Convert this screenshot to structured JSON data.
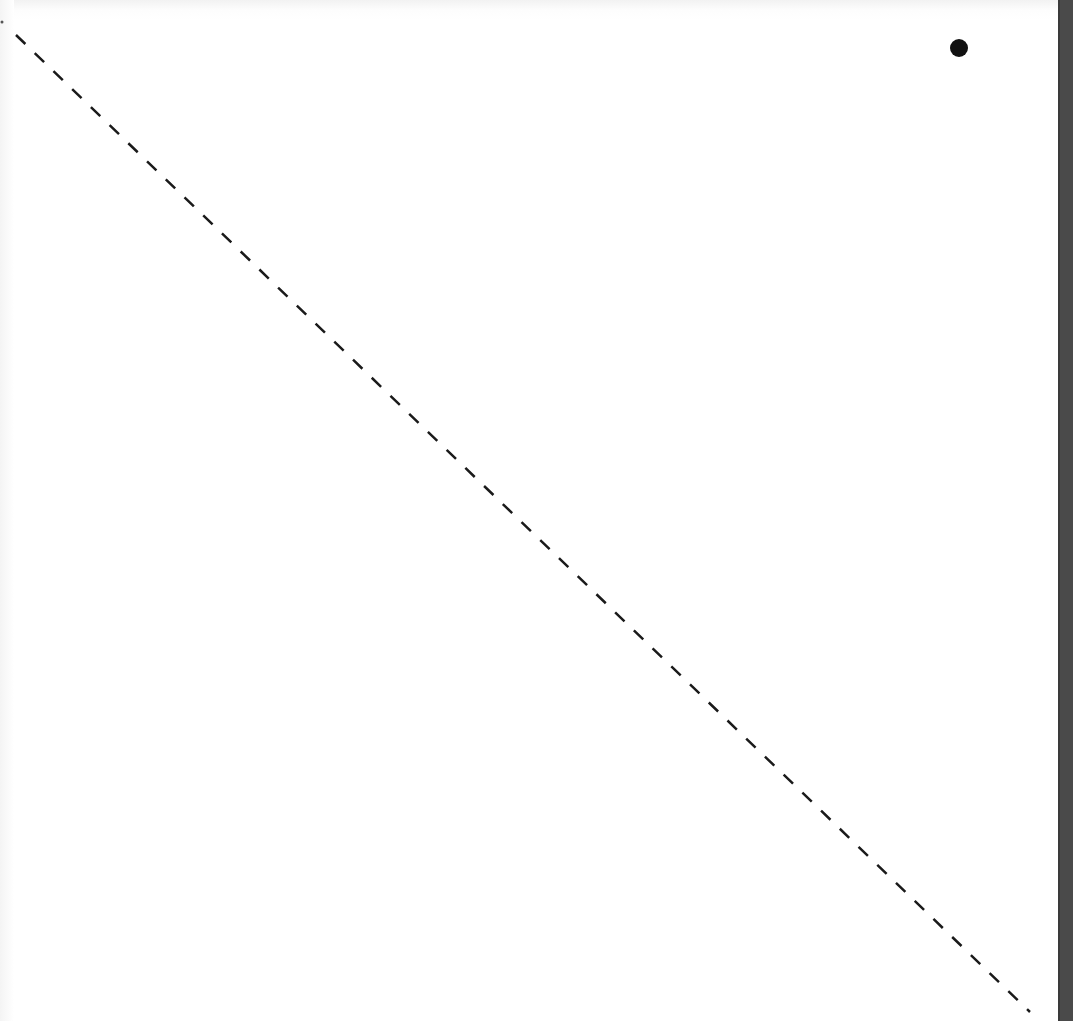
{
  "diagram": {
    "background_color": "#ffffff",
    "edge_strip_color": "#4a4a4a",
    "dashed_line": {
      "x1": 16,
      "y1": 35,
      "x2": 1030,
      "y2": 1012,
      "stroke": "#1a1a1a",
      "stroke_width": 2.5,
      "dash": "13 13"
    },
    "point": {
      "cx": 959,
      "cy": 48,
      "r": 9,
      "fill": "#111111"
    },
    "small_mark": {
      "cx": 2,
      "cy": 22,
      "r": 1.5,
      "fill": "#555555"
    }
  }
}
